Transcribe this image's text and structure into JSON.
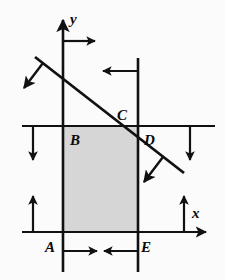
{
  "figure": {
    "name": "coordinate-geometry-diagram",
    "background_color": "#fbfbfb",
    "stroke_color": "#111111",
    "shaded_fill": "#d6d6d6",
    "width": 225,
    "height": 280
  },
  "axes": {
    "y_label": "y",
    "x_label": "x",
    "y_axis": {
      "x": 63,
      "y_top": 14,
      "y_bottom": 272
    },
    "x_axis": {
      "y": 232,
      "x_left": 22,
      "x_right": 215
    }
  },
  "points": [
    {
      "id": "A",
      "label": "A",
      "x": 48,
      "y": 248,
      "desc": "lower-left-vertex"
    },
    {
      "id": "B",
      "label": "B",
      "x": 72,
      "y": 142,
      "desc": "upper-left-vertex"
    },
    {
      "id": "C",
      "label": "C",
      "x": 120,
      "y": 122,
      "desc": "diagonal-top-intersection"
    },
    {
      "id": "D",
      "label": "D",
      "x": 143,
      "y": 143,
      "desc": "diagonal-right-intersection"
    },
    {
      "id": "E",
      "label": "E",
      "x": 143,
      "y": 248,
      "desc": "lower-right-vertex"
    }
  ],
  "shaded_region": {
    "name": "shaded-rectangle",
    "left": 63,
    "right": 138,
    "top": 126,
    "bottom": 232,
    "fill": "#d6d6d6"
  },
  "lines": {
    "horizontal_bd": {
      "y": 126,
      "x_left": 22,
      "x_right": 215
    },
    "vertical_right": {
      "x": 138,
      "y_top": 58,
      "y_bottom": 272
    },
    "diagonal": {
      "x1": 35,
      "y1": 57,
      "x2": 184,
      "y2": 173
    }
  },
  "arrows": [
    {
      "id": "arrow-top-right",
      "desc": "horizontal-arrow-right-from-y-axis",
      "direction": "right"
    },
    {
      "id": "arrow-top-left-inward",
      "desc": "horizontal-arrow-left-from-right-line",
      "direction": "left"
    },
    {
      "id": "arrow-normal-upper",
      "desc": "diagonal-normal-arrow-down-left",
      "direction": "down-left"
    },
    {
      "id": "arrow-normal-lower",
      "desc": "diagonal-normal-arrow-down-left",
      "direction": "down-left"
    },
    {
      "id": "arrow-left-down",
      "desc": "vertical-arrow-down-left-of-B",
      "direction": "down"
    },
    {
      "id": "arrow-right-down",
      "desc": "vertical-arrow-down-right-side",
      "direction": "down"
    },
    {
      "id": "arrow-left-up",
      "desc": "vertical-arrow-up-left-of-A",
      "direction": "up"
    },
    {
      "id": "arrow-right-up",
      "desc": "vertical-arrow-up-right-of-E",
      "direction": "up"
    },
    {
      "id": "arrow-dim-right",
      "desc": "dimension-arrow-right-below-A",
      "direction": "right"
    },
    {
      "id": "arrow-dim-left",
      "desc": "dimension-arrow-left-below-E",
      "direction": "left"
    },
    {
      "id": "arrow-bottom-left",
      "desc": "horizontal-arrow-left-below-E",
      "direction": "left"
    },
    {
      "id": "arrow-y-axis-tip",
      "desc": "y-axis-arrowhead-up",
      "direction": "up"
    },
    {
      "id": "arrow-x-axis-tip",
      "desc": "x-axis-arrowhead-right",
      "direction": "right"
    }
  ]
}
